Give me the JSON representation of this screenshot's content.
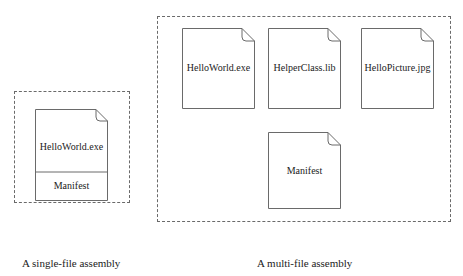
{
  "single_file_assembly": {
    "caption": "A single-file assembly",
    "document": {
      "file_label": "HelloWorld.exe",
      "manifest_label": "Manifest"
    }
  },
  "multi_file_assembly": {
    "caption": "A multi-file assembly",
    "documents": [
      {
        "label": "HelloWorld.exe"
      },
      {
        "label": "HelperClass.lib"
      },
      {
        "label": "HelloPicture.jpg"
      },
      {
        "label": "Manifest"
      }
    ]
  },
  "colors": {
    "border": "#6a6a6a",
    "text": "#222222",
    "background": "#ffffff"
  }
}
